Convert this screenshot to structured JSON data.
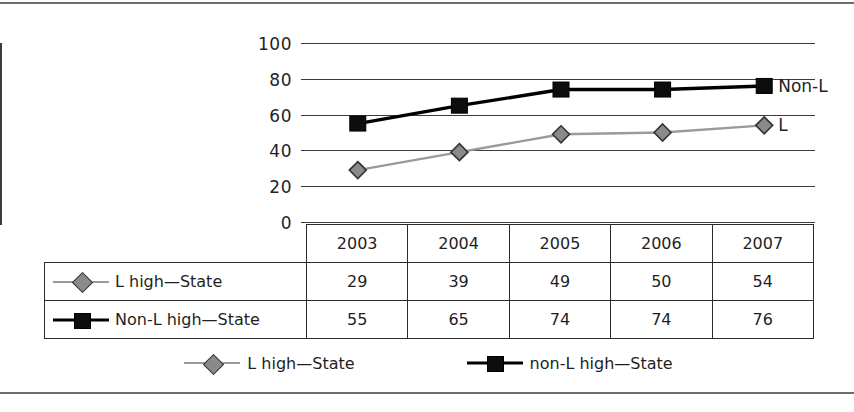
{
  "chart_data": {
    "type": "line",
    "title": "",
    "xlabel": "",
    "ylabel": "",
    "categories": [
      "2003",
      "2004",
      "2005",
      "2006",
      "2007"
    ],
    "ylim": [
      0,
      100
    ],
    "yticks": [
      0,
      20,
      40,
      60,
      80,
      100
    ],
    "grid": true,
    "legend_position": "bottom",
    "series": [
      {
        "name": "L high—State",
        "legend_name": "L high—State",
        "end_annotation": "L",
        "marker": "diamond",
        "color": "#8a8a8a",
        "line_color": "#9a9a9a",
        "values": [
          29,
          39,
          49,
          50,
          54
        ]
      },
      {
        "name": "Non-L high—State",
        "legend_name": "non-L high—State",
        "end_annotation": "Non-L",
        "marker": "square",
        "color": "#0d0d0d",
        "line_color": "#000000",
        "values": [
          55,
          65,
          74,
          74,
          76
        ]
      }
    ]
  },
  "axis": {
    "y_tick_labels": [
      "100",
      "80",
      "60",
      "40",
      "20",
      "0"
    ]
  },
  "table": {
    "corner_label": "",
    "column_headers": [
      "2003",
      "2004",
      "2005",
      "2006",
      "2007"
    ],
    "rows": [
      {
        "label": "L high—State",
        "marker": "diamond",
        "values": [
          "29",
          "39",
          "49",
          "50",
          "54"
        ]
      },
      {
        "label": "Non-L high—State",
        "marker": "square",
        "values": [
          "55",
          "65",
          "74",
          "74",
          "76"
        ]
      }
    ]
  },
  "legend": {
    "entries": [
      {
        "label": "L high—State",
        "marker": "diamond"
      },
      {
        "label": "non-L high—State",
        "marker": "square"
      }
    ]
  },
  "colors": {
    "series_gray": "#8a8a8a",
    "series_black": "#0d0d0d",
    "gridline": "#3c3c3c",
    "table_border": "#2b2b2b",
    "page_rule": "#6d6d6d"
  }
}
